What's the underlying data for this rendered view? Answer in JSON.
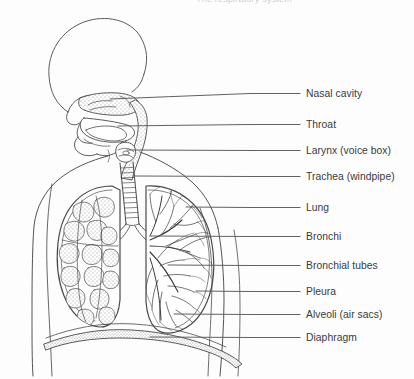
{
  "figure": {
    "title_partial": "The respiratory system",
    "background_color": "#fdfdfd",
    "ink_color": "#3a3a3c",
    "stipple_color": "#8e8e90"
  },
  "labels": [
    {
      "id": "nasal-cavity",
      "text": "Nasal cavity",
      "y": 88,
      "leader_x1": 110,
      "leader_y1": 99,
      "leader_x2": 300
    },
    {
      "id": "throat",
      "text": "Throat",
      "y": 119,
      "leader_x1": 118,
      "leader_y1": 126,
      "leader_x2": 300
    },
    {
      "id": "larynx",
      "text": "Larynx (voice box)",
      "y": 145,
      "leader_x1": 127,
      "leader_y1": 150,
      "leader_x2": 300
    },
    {
      "id": "trachea",
      "text": "Trachea (windpipe)",
      "y": 171,
      "leader_x1": 133,
      "leader_y1": 176,
      "leader_x2": 300
    },
    {
      "id": "lung",
      "text": "Lung",
      "y": 202,
      "leader_x1": 186,
      "leader_y1": 207,
      "leader_x2": 300
    },
    {
      "id": "bronchi",
      "text": "Bronchi",
      "y": 231,
      "leader_x1": 150,
      "leader_y1": 236,
      "leader_x2": 300
    },
    {
      "id": "bronchial-tubes",
      "text": "Bronchial tubes",
      "y": 260,
      "leader_x1": 168,
      "leader_y1": 265,
      "leader_x2": 300
    },
    {
      "id": "pleura",
      "text": "Pleura",
      "y": 286,
      "leader_x1": 196,
      "leader_y1": 291,
      "leader_x2": 300
    },
    {
      "id": "alveoli",
      "text": "Alveoli (air sacs)",
      "y": 309,
      "leader_x1": 174,
      "leader_y1": 314,
      "leader_x2": 300
    },
    {
      "id": "diaphragm",
      "text": "Diaphragm",
      "y": 332,
      "leader_x1": 150,
      "leader_y1": 337,
      "leader_x2": 300
    }
  ],
  "anatomy_parts": [
    "head-profile",
    "nasal-cavity-region",
    "oral-cavity",
    "tongue",
    "throat-pharynx",
    "larynx",
    "trachea",
    "left-bronchus",
    "right-bronchus",
    "left-lung-alveolar-lobules",
    "right-lung-bronchial-tree",
    "pleural-membrane",
    "diaphragm-dome",
    "torso-outline",
    "shoulder-arm-outline"
  ],
  "label_text_x": 306,
  "label_count": 10
}
